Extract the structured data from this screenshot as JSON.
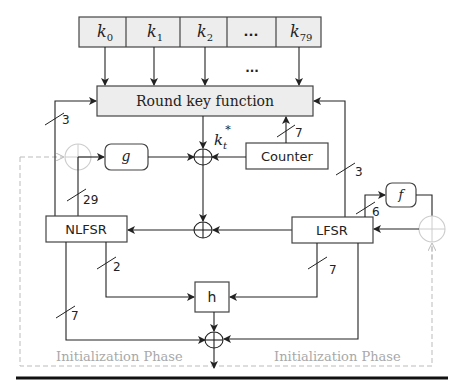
{
  "diagram": {
    "key_register": {
      "cells": [
        {
          "base": "k",
          "sub": "0"
        },
        {
          "base": "k",
          "sub": "1"
        },
        {
          "base": "k",
          "sub": "2"
        },
        {
          "base": "...",
          "sub": ""
        },
        {
          "base": "k",
          "sub": "79"
        }
      ],
      "between_dots": "..."
    },
    "round_key_function": {
      "label": "Round key function"
    },
    "round_key_output": {
      "base": "k",
      "sub": "t",
      "sup": "*"
    },
    "counter": {
      "label": "Counter",
      "width": "7"
    },
    "g_function": {
      "label": "g"
    },
    "f_function": {
      "label": "f"
    },
    "h_function": {
      "label": "h"
    },
    "nlfsr": {
      "label": "NLFSR"
    },
    "lfsr": {
      "label": "LFSR"
    },
    "bus_widths": {
      "nlfsr_to_round_key": "3",
      "nlfsr_to_g": "29",
      "lfsr_to_round_key": "3",
      "lfsr_to_f": "6",
      "nlfsr_to_h": "2",
      "lfsr_to_h": "7",
      "nlfsr_to_output": "7"
    },
    "phase_labels": {
      "left": "Initialization Phase",
      "right": "Initialization Phase"
    },
    "colors": {
      "box_fill": "#ededed",
      "line": "#222222",
      "init_path": "#bbbbbb"
    }
  }
}
